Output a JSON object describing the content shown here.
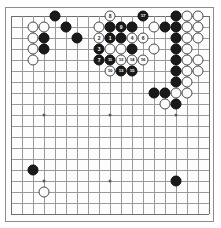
{
  "app": {
    "title": "Go Board Diagram",
    "board_size": 19
  },
  "board": {
    "colors": {
      "background": "#fdfdfd",
      "grid_line": "#9a9a9a",
      "border": "#8d8d8d",
      "black_stone": "#1a1a1a",
      "white_stone": "#fcfcfc",
      "black_label": "#ffffff",
      "white_label": "#1a1a1a",
      "hoshi": "#5a5a5a"
    },
    "grid": {
      "size": 19,
      "spacing": 11,
      "origin_x": 10,
      "origin_y": 12
    },
    "hoshi_points": [
      {
        "col": 3,
        "row": 3
      },
      {
        "col": 9,
        "row": 3
      },
      {
        "col": 15,
        "row": 3
      },
      {
        "col": 3,
        "row": 9
      },
      {
        "col": 9,
        "row": 9
      },
      {
        "col": 15,
        "row": 9
      },
      {
        "col": 3,
        "row": 15
      },
      {
        "col": 9,
        "row": 15
      },
      {
        "col": 15,
        "row": 15
      }
    ],
    "stones": [
      {
        "col": 4,
        "row": 0,
        "color": "black",
        "label": ""
      },
      {
        "col": 2,
        "row": 1,
        "color": "white",
        "label": ""
      },
      {
        "col": 3,
        "row": 1,
        "color": "white",
        "label": ""
      },
      {
        "col": 5,
        "row": 1,
        "color": "black",
        "label": ""
      },
      {
        "col": 2,
        "row": 2,
        "color": "white",
        "label": ""
      },
      {
        "col": 3,
        "row": 2,
        "color": "black",
        "label": ""
      },
      {
        "col": 6,
        "row": 2,
        "color": "black",
        "label": ""
      },
      {
        "col": 2,
        "row": 3,
        "color": "white",
        "label": ""
      },
      {
        "col": 3,
        "row": 3,
        "color": "black",
        "label": ""
      },
      {
        "col": 2,
        "row": 4,
        "color": "white",
        "label": ""
      },
      {
        "col": 9,
        "row": 0,
        "color": "white",
        "label": "8"
      },
      {
        "col": 12,
        "row": 0,
        "color": "black",
        "label": "17"
      },
      {
        "col": 15,
        "row": 0,
        "color": "black",
        "label": ""
      },
      {
        "col": 16,
        "row": 0,
        "color": "white",
        "label": ""
      },
      {
        "col": 17,
        "row": 0,
        "color": "white",
        "label": ""
      },
      {
        "col": 8,
        "row": 1,
        "color": "white",
        "label": ""
      },
      {
        "col": 9,
        "row": 1,
        "color": "black",
        "label": ""
      },
      {
        "col": 10,
        "row": 1,
        "color": "black",
        "label": "9"
      },
      {
        "col": 11,
        "row": 1,
        "color": "black",
        "label": ""
      },
      {
        "col": 13,
        "row": 1,
        "color": "white",
        "label": ""
      },
      {
        "col": 14,
        "row": 1,
        "color": "black",
        "label": ""
      },
      {
        "col": 15,
        "row": 1,
        "color": "black",
        "label": ""
      },
      {
        "col": 16,
        "row": 1,
        "color": "white",
        "label": ""
      },
      {
        "col": 17,
        "row": 1,
        "color": "white",
        "label": ""
      },
      {
        "col": 8,
        "row": 2,
        "color": "white",
        "label": "2"
      },
      {
        "col": 9,
        "row": 2,
        "color": "black",
        "label": "1"
      },
      {
        "col": 10,
        "row": 2,
        "color": "black",
        "label": ""
      },
      {
        "col": 11,
        "row": 2,
        "color": "white",
        "label": "4"
      },
      {
        "col": 12,
        "row": 2,
        "color": "white",
        "label": "6"
      },
      {
        "col": 15,
        "row": 2,
        "color": "black",
        "label": ""
      },
      {
        "col": 16,
        "row": 2,
        "color": "white",
        "label": ""
      },
      {
        "col": 17,
        "row": 2,
        "color": "white",
        "label": ""
      },
      {
        "col": 8,
        "row": 3,
        "color": "black",
        "label": "3"
      },
      {
        "col": 9,
        "row": 3,
        "color": "white",
        "label": ""
      },
      {
        "col": 10,
        "row": 3,
        "color": "white",
        "label": ""
      },
      {
        "col": 11,
        "row": 3,
        "color": "black",
        "label": ""
      },
      {
        "col": 13,
        "row": 3,
        "color": "white",
        "label": ""
      },
      {
        "col": 15,
        "row": 3,
        "color": "black",
        "label": ""
      },
      {
        "col": 16,
        "row": 3,
        "color": "white",
        "label": ""
      },
      {
        "col": 8,
        "row": 4,
        "color": "black",
        "label": "7"
      },
      {
        "col": 9,
        "row": 4,
        "color": "black",
        "label": "11"
      },
      {
        "col": 10,
        "row": 4,
        "color": "white",
        "label": "12"
      },
      {
        "col": 11,
        "row": 4,
        "color": "white",
        "label": "14"
      },
      {
        "col": 12,
        "row": 4,
        "color": "white",
        "label": "16"
      },
      {
        "col": 15,
        "row": 4,
        "color": "black",
        "label": ""
      },
      {
        "col": 16,
        "row": 4,
        "color": "white",
        "label": ""
      },
      {
        "col": 17,
        "row": 4,
        "color": "white",
        "label": ""
      },
      {
        "col": 9,
        "row": 5,
        "color": "white",
        "label": "10"
      },
      {
        "col": 10,
        "row": 5,
        "color": "black",
        "label": "13"
      },
      {
        "col": 11,
        "row": 5,
        "color": "black",
        "label": "15"
      },
      {
        "col": 15,
        "row": 5,
        "color": "black",
        "label": ""
      },
      {
        "col": 16,
        "row": 5,
        "color": "white",
        "label": ""
      },
      {
        "col": 17,
        "row": 5,
        "color": "white",
        "label": ""
      },
      {
        "col": 15,
        "row": 6,
        "color": "black",
        "label": ""
      },
      {
        "col": 16,
        "row": 6,
        "color": "white",
        "label": ""
      },
      {
        "col": 13,
        "row": 7,
        "color": "black",
        "label": ""
      },
      {
        "col": 14,
        "row": 7,
        "color": "black",
        "label": ""
      },
      {
        "col": 15,
        "row": 7,
        "color": "white",
        "label": ""
      },
      {
        "col": 16,
        "row": 7,
        "color": "white",
        "label": ""
      },
      {
        "col": 14,
        "row": 8,
        "color": "white",
        "label": ""
      },
      {
        "col": 15,
        "row": 8,
        "color": "black",
        "label": ""
      },
      {
        "col": 2,
        "row": 14,
        "color": "black",
        "label": ""
      },
      {
        "col": 15,
        "row": 15,
        "color": "black",
        "label": ""
      },
      {
        "col": 3,
        "row": 16,
        "color": "white",
        "label": ""
      }
    ]
  }
}
